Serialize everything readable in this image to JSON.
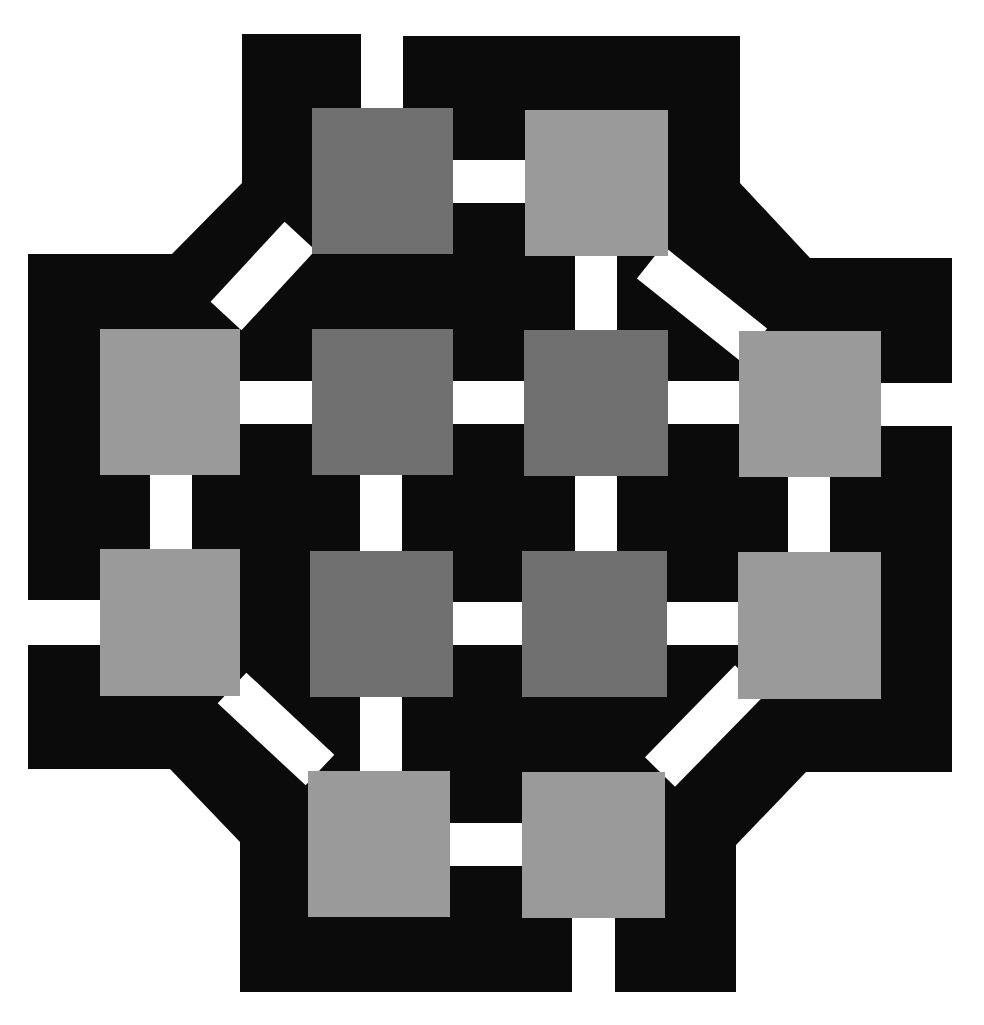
{
  "figure": {
    "title": "",
    "background": "#ffffff",
    "colors": {
      "frame": "#0b0b0b",
      "gap": "#ffffff",
      "inner_square": "#707070",
      "outer_square": "#9a9a9a"
    },
    "frame_polygon": "242,34 361,34 361,108 403,108 403,36 740,36 740,183 810,258 952,258 952,383 881,383 881,426 952,426 952,772 806,772 736,845 736,992 615,992 615,918 572,918 572,992 240,992 240,842 170,769 28,769 28,645 100,645 100,600 28,600 28,254 172,254 242,183",
    "gaps": [
      {
        "name": "gap-top-notch",
        "points": "361,30 403,30 403,110 361,110"
      },
      {
        "name": "gap-tl-tr",
        "points": "453,160 525,160 525,203 453,203"
      },
      {
        "name": "gap-tr-c2",
        "points": "575,256 617,256 617,330 575,330"
      },
      {
        "name": "gap-l1-c1",
        "points": "240,381 312,381 312,424 240,424"
      },
      {
        "name": "gap-c1-c2",
        "points": "453,381 524,381 524,424 453,424"
      },
      {
        "name": "gap-c2-r1",
        "points": "668,381 739,381 739,424 668,424"
      },
      {
        "name": "gap-r1-right",
        "points": "881,383 956,383 956,426 881,426"
      },
      {
        "name": "gap-l1-l2",
        "points": "150,475 192,475 192,549 150,549"
      },
      {
        "name": "gap-c1-c3",
        "points": "360,475 402,475 402,551 360,551"
      },
      {
        "name": "gap-c2-c4",
        "points": "575,476 617,476 617,551 575,551"
      },
      {
        "name": "gap-r1-r2",
        "points": "788,477 830,477 830,552 788,552"
      },
      {
        "name": "gap-left-l2",
        "points": "24,600 100,600 100,645 24,645"
      },
      {
        "name": "gap-c3-c4",
        "points": "453,602 522,602 522,645 453,645"
      },
      {
        "name": "gap-c4-r2",
        "points": "667,602 738,602 738,645 667,645"
      },
      {
        "name": "gap-c3-bl",
        "points": "360,697 402,697 402,771 360,771"
      },
      {
        "name": "gap-bl-br",
        "points": "450,823 522,823 522,866 450,866"
      },
      {
        "name": "gap-bottom-notch",
        "points": "572,918 615,918 615,996 572,996"
      },
      {
        "name": "diag-tl-l1",
        "points": "312,224 312,254 243,329 212,329"
      },
      {
        "name": "diag-tr-r1",
        "points": "640,256 668,256 768,331 739,331 739,358"
      },
      {
        "name": "diag-tr-r1b",
        "points": "640,256 670,256 760,331 739,331"
      },
      {
        "name": "diag-l2-bl",
        "points": "221,696 250,696 340,771 308,771 308,792"
      },
      {
        "name": "diag-r2-br",
        "points": "738,672 738,699 665,772 665,800"
      }
    ],
    "squares": [
      {
        "name": "square-top-left",
        "x": 312,
        "y": 108,
        "w": 141,
        "h": 146,
        "tone": "inner_square"
      },
      {
        "name": "square-top-right",
        "x": 525,
        "y": 110,
        "w": 143,
        "h": 146,
        "tone": "outer_square"
      },
      {
        "name": "square-left-1",
        "x": 100,
        "y": 329,
        "w": 140,
        "h": 146,
        "tone": "outer_square"
      },
      {
        "name": "square-center-1",
        "x": 312,
        "y": 329,
        "w": 141,
        "h": 146,
        "tone": "inner_square"
      },
      {
        "name": "square-center-2",
        "x": 524,
        "y": 330,
        "w": 144,
        "h": 146,
        "tone": "inner_square"
      },
      {
        "name": "square-right-1",
        "x": 739,
        "y": 331,
        "w": 142,
        "h": 146,
        "tone": "outer_square"
      },
      {
        "name": "square-left-2",
        "x": 100,
        "y": 549,
        "w": 140,
        "h": 147,
        "tone": "outer_square"
      },
      {
        "name": "square-center-3",
        "x": 310,
        "y": 551,
        "w": 143,
        "h": 146,
        "tone": "inner_square"
      },
      {
        "name": "square-center-4",
        "x": 522,
        "y": 551,
        "w": 145,
        "h": 146,
        "tone": "inner_square"
      },
      {
        "name": "square-right-2",
        "x": 738,
        "y": 552,
        "w": 143,
        "h": 147,
        "tone": "outer_square"
      },
      {
        "name": "square-bottom-left",
        "x": 308,
        "y": 771,
        "w": 142,
        "h": 146,
        "tone": "outer_square"
      },
      {
        "name": "square-bottom-right",
        "x": 522,
        "y": 772,
        "w": 143,
        "h": 146,
        "tone": "outer_square"
      }
    ]
  }
}
